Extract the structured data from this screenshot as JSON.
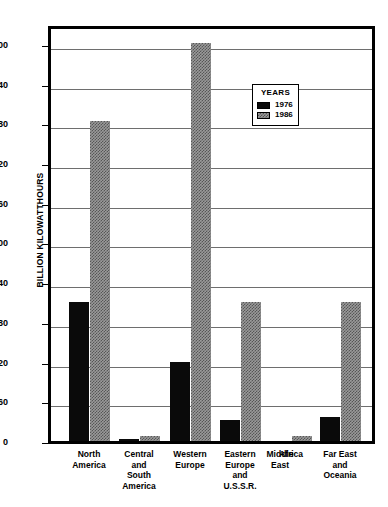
{
  "chart_data": {
    "type": "bar",
    "title": "",
    "subtitle": "",
    "xlabel": "",
    "ylabel": "BILLION KILOWATTHOURS",
    "ylim": [
      0,
      630
    ],
    "yticks": [
      0,
      60,
      120,
      180,
      240,
      300,
      360,
      420,
      480,
      540,
      600
    ],
    "ytick_labels": [
      "0",
      "60",
      "120",
      "180",
      "240",
      "300",
      "360",
      "420",
      "480",
      "540",
      "600"
    ],
    "grid": true,
    "legend": {
      "title": "YEARS",
      "position": "inside-upper-right",
      "entries": [
        {
          "name": "1976",
          "color": "#0a0a0a",
          "pattern": "solid-black"
        },
        {
          "name": "1986",
          "color": "#9a9a9a",
          "pattern": "gray-hatched"
        }
      ]
    },
    "categories": [
      "North America",
      "Central and South America",
      "Western Europe",
      "Eastern Europe and U.S.S.R.",
      "Middle East",
      "Africa",
      "Far East and Oceania"
    ],
    "category_lines": [
      [
        "North",
        "America"
      ],
      [
        "Central",
        "and",
        "South",
        "America"
      ],
      [
        "Western",
        "Europe"
      ],
      [
        "Eastern",
        "Europe",
        "and",
        "U.S.S.R."
      ],
      [
        "Middle",
        "East"
      ],
      [
        "Africa"
      ],
      [
        "Far East",
        "and",
        "Oceania"
      ]
    ],
    "series": [
      {
        "name": "1976",
        "color": "#0a0a0a",
        "values": [
          210,
          3,
          119,
          31,
          0,
          0,
          37
        ]
      },
      {
        "name": "1986",
        "color": "#9a9a9a",
        "values": [
          483,
          8,
          602,
          210,
          0,
          8,
          210
        ]
      }
    ]
  },
  "layout": {
    "plot_left": 48,
    "plot_top": 26,
    "plot_width": 327,
    "plot_height": 418,
    "baseline_y": 443,
    "value_top": 630,
    "group_centers": [
      89,
      139,
      190,
      240,
      280,
      291,
      340
    ],
    "bar_width": 20,
    "bar_gap": 1
  }
}
